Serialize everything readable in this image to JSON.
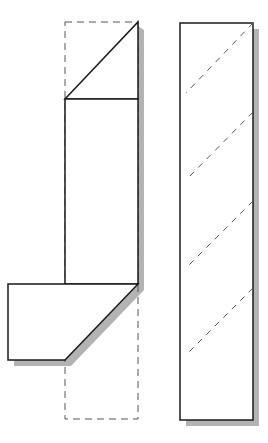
{
  "diagram": {
    "type": "folding-pattern",
    "colors": {
      "stroke": "#1a1a1a",
      "dashed": "#555555",
      "shadow": "#b3b3b3",
      "fill": "#ffffff"
    },
    "left_piece": {
      "fold_outline_dashed": {
        "x": 65,
        "y": 22,
        "width": 73,
        "height": 397
      },
      "top_triangle": [
        [
          65,
          99
        ],
        [
          138,
          22
        ],
        [
          138,
          99
        ]
      ],
      "middle_rect": {
        "x": 65,
        "y": 99,
        "width": 73,
        "height": 185
      },
      "bottom_flap": [
        [
          8,
          284
        ],
        [
          138,
          284
        ],
        [
          65,
          360
        ],
        [
          8,
          360
        ]
      ]
    },
    "right_piece": {
      "rect": {
        "x": 180,
        "y": 23,
        "width": 73,
        "height": 397
      },
      "dashed_diagonals": [
        [
          [
            253,
            23
          ],
          [
            186,
            93
          ]
        ],
        [
          [
            253,
            112
          ],
          [
            186,
            180
          ]
        ],
        [
          [
            253,
            201
          ],
          [
            186,
            268
          ]
        ],
        [
          [
            253,
            288
          ],
          [
            186,
            355
          ]
        ]
      ]
    }
  }
}
